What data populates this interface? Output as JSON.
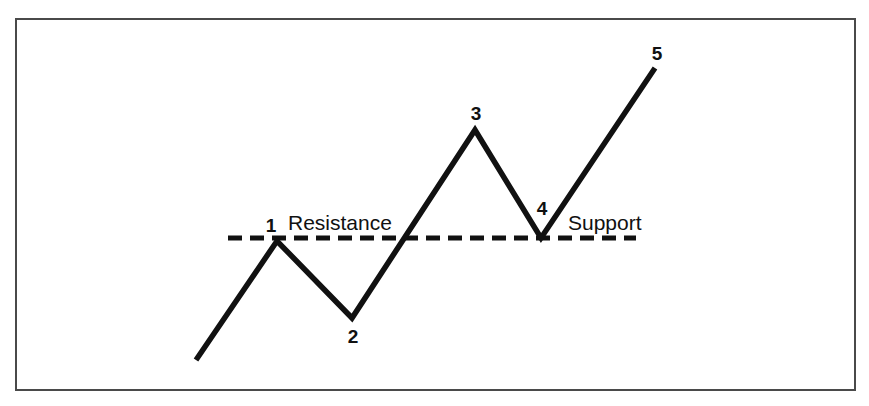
{
  "chart_data": {
    "type": "line",
    "title": "",
    "subtitle": "",
    "xlabel": "",
    "ylabel": "",
    "xlim": [
      0,
      869
    ],
    "ylim": [
      406,
      0
    ],
    "grid": false,
    "legend": null,
    "series": [
      {
        "name": "price-path",
        "points": [
          {
            "label": "",
            "x": 196,
            "y": 360
          },
          {
            "label": "1",
            "x": 277,
            "y": 241
          },
          {
            "label": "2",
            "x": 352,
            "y": 318
          },
          {
            "label": "3",
            "x": 475,
            "y": 130
          },
          {
            "label": "4",
            "x": 541,
            "y": 238
          },
          {
            "label": "5",
            "x": 655,
            "y": 68
          }
        ]
      }
    ],
    "point_labels": [
      {
        "text": "1",
        "x": 271,
        "y": 232,
        "anchor": "middle"
      },
      {
        "text": "2",
        "x": 353,
        "y": 343,
        "anchor": "middle"
      },
      {
        "text": "3",
        "x": 476,
        "y": 120,
        "anchor": "middle"
      },
      {
        "text": "4",
        "x": 542,
        "y": 215,
        "anchor": "middle"
      },
      {
        "text": "5",
        "x": 657,
        "y": 60,
        "anchor": "middle"
      }
    ],
    "annotations": [
      {
        "name": "resistance",
        "text": "Resistance",
        "x": 288,
        "y": 230,
        "anchor": "start"
      },
      {
        "name": "support",
        "text": "Support",
        "x": 568,
        "y": 230,
        "anchor": "start"
      }
    ],
    "reference_line": {
      "name": "resistance-support-level",
      "style": "dashed",
      "y": 238,
      "x_start": 228,
      "x_end": 636,
      "dash_length": 14,
      "gap_length": 8,
      "stroke_width": 5
    },
    "frame": {
      "name": "border",
      "x": 16,
      "y": 19,
      "width": 839,
      "height": 371,
      "stroke_width": 2
    },
    "colors": {
      "line": "#111111",
      "dashed_line": "#111111",
      "text": "#111111",
      "background": "#ffffff",
      "border": "#4a4a4a"
    }
  }
}
